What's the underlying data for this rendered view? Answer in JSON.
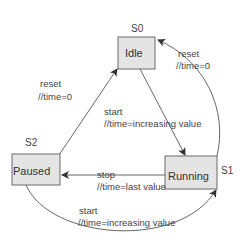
{
  "diagram": {
    "type": "state-machine",
    "states": [
      {
        "id": "S0",
        "label": "Idle"
      },
      {
        "id": "S1",
        "label": "Running"
      },
      {
        "id": "S2",
        "label": "Paused"
      }
    ],
    "transitions": [
      {
        "from": "S0",
        "to": "S1",
        "event": "start",
        "action": "//time=increasing value"
      },
      {
        "from": "S1",
        "to": "S0",
        "event": "reset",
        "action": "//time=0"
      },
      {
        "from": "S1",
        "to": "S2",
        "event": "stop",
        "action": "//time=last value"
      },
      {
        "from": "S2",
        "to": "S0",
        "event": "reset",
        "action": "//time=0"
      },
      {
        "from": "S2",
        "to": "S1",
        "event": "start",
        "action": "//time=increasing value"
      }
    ]
  },
  "colors": {
    "box_fill": "#e4e4e4",
    "box_border": "#6a6a6a",
    "edge": "#555555",
    "text": "#333333"
  }
}
